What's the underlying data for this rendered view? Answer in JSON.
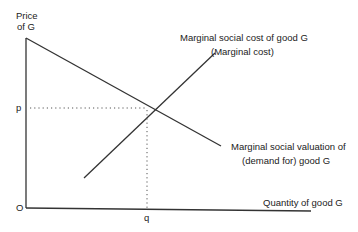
{
  "diagram": {
    "y_axis_label_line1": "Price",
    "y_axis_label_line2": "of G",
    "x_axis_label": "Quantity of good G",
    "origin_label": "O",
    "price_label": "p",
    "quantity_label": "q",
    "supply_label_line1": "Marginal social cost of good G",
    "supply_label_line2": "(Marginal cost)",
    "demand_label_line1": "Marginal social valuation of",
    "demand_label_line2": "(demand for) good G"
  },
  "colors": {
    "line": "#333333",
    "dotted": "#555555"
  }
}
